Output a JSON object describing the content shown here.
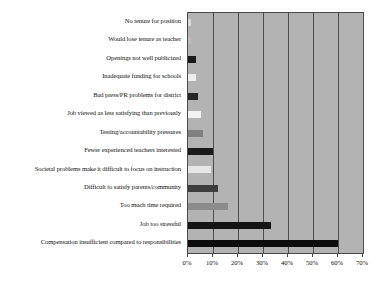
{
  "chart_data": {
    "type": "bar",
    "orientation": "horizontal",
    "title": "",
    "subtitle": "",
    "xlabel": "",
    "ylabel": "",
    "xlim": [
      0,
      70
    ],
    "xticks": [
      "0%",
      "10%",
      "20%",
      "30%",
      "40%",
      "50%",
      "60%",
      "70%"
    ],
    "xtick_values": [
      0,
      10,
      20,
      30,
      40,
      50,
      60,
      70
    ],
    "grid": "vertical",
    "legend": "none",
    "plot_background": "#b3b3b3",
    "categories": [
      "No tenure for position",
      "Would lose tenure as teacher",
      "Openings not well publicized",
      "Inadequate funding for schools",
      "Bad press/PR problems for district",
      "Job viewed as less satisfying than previously",
      "Testing/accountability pressures",
      "Fewer experienced teachers interested",
      "Societal problems make it difficult to focus on instruction",
      "Difficult to satisfy parents/community",
      "Too much time required",
      "Job too stressful",
      "Compensation insufficient compared to responsibilities"
    ],
    "values": [
      1,
      1,
      3,
      3,
      4,
      5,
      6,
      10,
      9,
      12,
      16,
      33,
      60
    ],
    "bar_colors": [
      "#d9d9d9",
      "#bdbdbd",
      "#1a1a1a",
      "#ededed",
      "#262626",
      "#f2f2f2",
      "#808080",
      "#1a1a1a",
      "#e6e6e6",
      "#3d3d3d",
      "#8c8c8c",
      "#141414",
      "#0d0d0d"
    ]
  }
}
